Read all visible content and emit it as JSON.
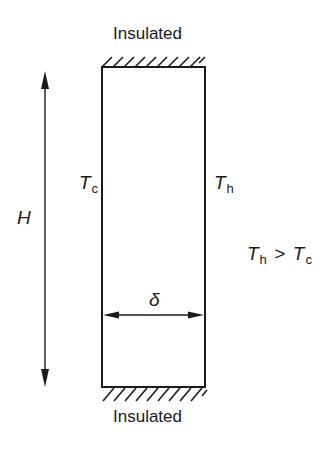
{
  "diagram": {
    "top_boundary_label": "Insulated",
    "bottom_boundary_label": "Insulated",
    "height_label": "H",
    "width_label": "δ",
    "left_wall": {
      "symbol": "T",
      "subscript": "c"
    },
    "right_wall": {
      "symbol": "T",
      "subscript": "h"
    },
    "condition": {
      "lhs_symbol": "T",
      "lhs_subscript": "h",
      "operator": ">",
      "rhs_symbol": "T",
      "rhs_subscript": "c"
    }
  }
}
